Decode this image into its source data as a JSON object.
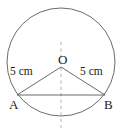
{
  "figure": {
    "kind": "geometry-diagram",
    "background_color": "#ffffff",
    "stroke_color": "#5a5a5a",
    "dash_color": "#b0b0b0",
    "text_color": "#1a1a1a",
    "width": 122,
    "height": 131
  },
  "circle": {
    "name": "main-circle",
    "center_x": 61,
    "center_y": 62,
    "radius": 54
  },
  "points": [
    {
      "id": "O",
      "label": "O",
      "x": 61,
      "y": 67
    },
    {
      "id": "A",
      "label": "A",
      "x": 17,
      "y": 95
    },
    {
      "id": "B",
      "label": "B",
      "x": 105,
      "y": 95
    }
  ],
  "segments": [
    {
      "id": "OA",
      "from": "O",
      "to": "A",
      "style": "solid"
    },
    {
      "id": "OB",
      "from": "O",
      "to": "B",
      "style": "solid"
    },
    {
      "id": "AB",
      "from": "A",
      "to": "B",
      "style": "solid"
    }
  ],
  "dashed_axis": {
    "name": "vertical-symmetry-axis",
    "x": 61,
    "y_start": 42,
    "y_end": 128,
    "style": "dashed"
  },
  "measurements": {
    "radius_left_label": "5 cm",
    "radius_right_label": "5 cm"
  },
  "chart_data": {
    "type": "diagram",
    "title": "",
    "shape": "circle",
    "radius_value": 5,
    "radius_units": "cm",
    "labels": [
      "O",
      "A",
      "B",
      "5 cm",
      "5 cm"
    ]
  }
}
